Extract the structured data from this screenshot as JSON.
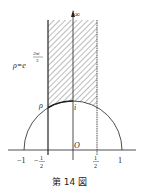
{
  "figure": {
    "caption": "第 14 図",
    "labels": {
      "i_infinity": "i∞",
      "rho_lhs": "ρ=e",
      "rho_exponent_num": "2πi",
      "rho_exponent_den": "3",
      "rho_point": "ρ",
      "i_point": "i",
      "origin": "O"
    },
    "ticks": {
      "minus_one": "−1",
      "minus_half_sign": "−",
      "half_num": "1",
      "half_den": "2",
      "plus_one": "1"
    },
    "colors": {
      "ink": "#222222",
      "hatch": "#555555",
      "background": "#ffffff"
    }
  }
}
